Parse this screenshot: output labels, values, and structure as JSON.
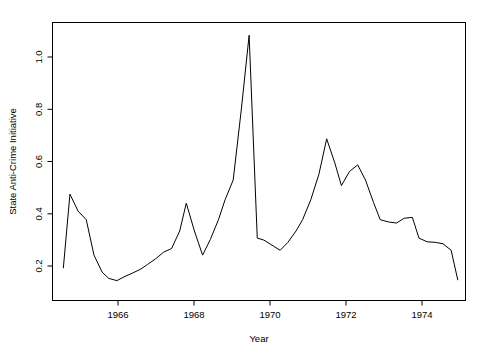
{
  "figure": {
    "background_color": "#ffffff",
    "foreground_color": "#000000"
  },
  "chart_data": {
    "type": "line",
    "title": "",
    "subtitle": "",
    "xlabel": "Year",
    "ylabel": "State Anti-Crime Initiative",
    "xlim": [
      1964.55,
      1975.2
    ],
    "ylim": [
      0.085,
      1.065
    ],
    "grid": false,
    "legend": null,
    "legend_position": "none",
    "line_color": "#000000",
    "xticks": [
      1966,
      1968,
      1970,
      1972,
      1974
    ],
    "xtick_labels": [
      "1966",
      "1968",
      "1970",
      "1972",
      "1974"
    ],
    "yticks": [
      0.2,
      0.4,
      0.6,
      0.8,
      1.0
    ],
    "ytick_labels": [
      "0.2",
      "0.4",
      "0.6",
      "0.8",
      "1.0"
    ],
    "series": [
      {
        "name": "State Anti-Crime Initiative",
        "x": [
          1964.83,
          1965.0,
          1965.21,
          1965.42,
          1965.62,
          1965.83,
          1966.0,
          1966.21,
          1966.42,
          1966.62,
          1966.83,
          1967.0,
          1967.21,
          1967.42,
          1967.62,
          1967.83,
          1968.0,
          1968.21,
          1968.42,
          1968.62,
          1968.83,
          1969.0,
          1969.21,
          1969.42,
          1969.62,
          1969.83,
          1970.0,
          1970.21,
          1970.42,
          1970.62,
          1970.83,
          1971.0,
          1971.21,
          1971.42,
          1971.62,
          1971.83,
          1972.0,
          1972.21,
          1972.42,
          1972.62,
          1972.83,
          1973.0,
          1973.21,
          1973.42,
          1973.62,
          1973.83,
          1974.0,
          1974.21,
          1974.42,
          1974.62,
          1974.83,
          1975.0
        ],
        "y": [
          0.2,
          0.46,
          0.4,
          0.37,
          0.245,
          0.185,
          0.163,
          0.155,
          0.17,
          0.182,
          0.196,
          0.212,
          0.232,
          0.256,
          0.268,
          0.33,
          0.428,
          0.33,
          0.245,
          0.3,
          0.37,
          0.44,
          0.51,
          0.76,
          1.02,
          0.305,
          0.298,
          0.28,
          0.262,
          0.29,
          0.33,
          0.37,
          0.44,
          0.53,
          0.655,
          0.57,
          0.49,
          0.54,
          0.563,
          0.51,
          0.43,
          0.37,
          0.362,
          0.358,
          0.375,
          0.378,
          0.305,
          0.292,
          0.29,
          0.285,
          0.262,
          0.158
        ]
      }
    ],
    "annotations": [],
    "data_points_note": "Single black polyline, no markers"
  },
  "axes": {
    "x_axis_label": "Year",
    "y_axis_label": "State Anti-Crime Initiative",
    "box_style": "full-rectangle-frame",
    "tick_direction": "outward"
  }
}
